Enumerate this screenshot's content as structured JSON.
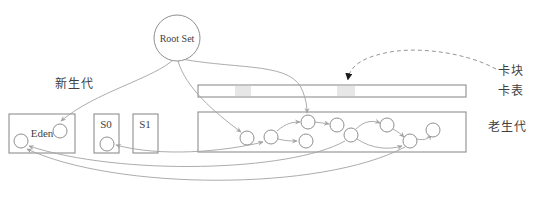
{
  "diagram": {
    "title_hint": "GC card table diagram",
    "colors": {
      "background": "#ffffff",
      "line": "#a3a3a3",
      "box_border": "#8f8f8f",
      "text": "#3f3f3f",
      "shaded_cell": "#e7e7e7",
      "dashed_arrow": "#8a8a8a",
      "dashed_arrowhead": "#1a1a1a"
    },
    "root_node": {
      "label": "Root Set",
      "cx": 177,
      "cy": 38,
      "r": 23
    },
    "labels": [
      {
        "id": "young-gen-label",
        "text": "新生代",
        "x": 74,
        "y": 88,
        "kind": "cn"
      },
      {
        "id": "card-block-label",
        "text": "卡块",
        "x": 511,
        "y": 75,
        "kind": "cn"
      },
      {
        "id": "card-table-label",
        "text": "卡表",
        "x": 511,
        "y": 95,
        "kind": "cn"
      },
      {
        "id": "old-gen-label",
        "text": "老生代",
        "x": 507,
        "y": 131,
        "kind": "cn"
      }
    ],
    "boxes": [
      {
        "id": "eden-box",
        "label": "Eden",
        "x": 9,
        "y": 114,
        "w": 66,
        "h": 39,
        "label_x": 42,
        "label_y": 137
      },
      {
        "id": "s0-box",
        "label": "S0",
        "x": 94,
        "y": 114,
        "w": 25,
        "h": 39,
        "label_x": 106,
        "label_y": 128
      },
      {
        "id": "s1-box",
        "label": "S1",
        "x": 133,
        "y": 114,
        "w": 25,
        "h": 39,
        "label_x": 145,
        "label_y": 128
      },
      {
        "id": "card-table-bar",
        "label": "",
        "x": 198,
        "y": 85,
        "w": 268,
        "h": 12
      },
      {
        "id": "old-gen-box",
        "label": "",
        "x": 198,
        "y": 112,
        "w": 268,
        "h": 40
      }
    ],
    "shaded_cells": [
      {
        "id": "marked-card-1",
        "x": 235,
        "y": 86,
        "w": 16,
        "h": 10
      },
      {
        "id": "marked-card-2",
        "x": 337,
        "y": 86,
        "w": 18,
        "h": 10
      }
    ],
    "object_nodes": [
      {
        "id": "eden-obj-left",
        "cx": 21,
        "cy": 141,
        "r": 7
      },
      {
        "id": "eden-obj-right",
        "cx": 60,
        "cy": 131,
        "r": 7
      },
      {
        "id": "s0-obj",
        "cx": 107,
        "cy": 144,
        "r": 7
      },
      {
        "id": "old-obj-1",
        "cx": 247,
        "cy": 138,
        "r": 7
      },
      {
        "id": "old-obj-2",
        "cx": 271,
        "cy": 137,
        "r": 7
      },
      {
        "id": "old-obj-3",
        "cx": 308,
        "cy": 122,
        "r": 7
      },
      {
        "id": "old-obj-4",
        "cx": 306,
        "cy": 141,
        "r": 7
      },
      {
        "id": "old-obj-5",
        "cx": 337,
        "cy": 125,
        "r": 7
      },
      {
        "id": "old-obj-6",
        "cx": 351,
        "cy": 135,
        "r": 7
      },
      {
        "id": "old-obj-7",
        "cx": 387,
        "cy": 125,
        "r": 7
      },
      {
        "id": "old-obj-8",
        "cx": 410,
        "cy": 141,
        "r": 7
      },
      {
        "id": "old-obj-9",
        "cx": 433,
        "cy": 130,
        "r": 7
      }
    ],
    "edges": [
      {
        "id": "root-to-eden-obj",
        "path": "M 174,59 C 155,78 95,92 61,121",
        "dashed": false,
        "start_arrow": false,
        "end_arrow": true,
        "dark": false
      },
      {
        "id": "root-to-old-obj-1",
        "path": "M 178,61 C 186,88 214,112 241,132",
        "dashed": false,
        "start_arrow": false,
        "end_arrow": true,
        "dark": false
      },
      {
        "id": "root-to-old-obj-3",
        "path": "M 181,59 C 243,70 293,62 303,92 C 306,100 307,106 307,113",
        "dashed": false,
        "start_arrow": false,
        "end_arrow": true,
        "dark": false
      },
      {
        "id": "s0-old-obj-2-link",
        "path": "M 116,145 C 160,157 222,152 263,142",
        "dashed": false,
        "start_arrow": true,
        "end_arrow": true,
        "dark": false
      },
      {
        "id": "old-2-to-old-3",
        "path": "M 277,131 C 286,123 293,122 300,122",
        "dashed": false,
        "start_arrow": false,
        "end_arrow": true,
        "dark": false
      },
      {
        "id": "old-2-to-old-4",
        "path": "M 278,139 C 286,141 290,141 297,141",
        "dashed": false,
        "start_arrow": false,
        "end_arrow": true,
        "dark": false
      },
      {
        "id": "old-3-to-old-5",
        "path": "M 315,122 C 321,123 324,123 329,124",
        "dashed": false,
        "start_arrow": false,
        "end_arrow": true,
        "dark": false
      },
      {
        "id": "old-6-to-old-7",
        "path": "M 356,129 C 364,121 372,120 380,123",
        "dashed": false,
        "start_arrow": false,
        "end_arrow": true,
        "dark": false
      },
      {
        "id": "old-7-to-old-8",
        "path": "M 393,129 C 398,132 401,134 404,137",
        "dashed": false,
        "start_arrow": false,
        "end_arrow": true,
        "dark": false
      },
      {
        "id": "old-6-to-old-8-low",
        "path": "M 357,139 C 372,149 389,150 402,146",
        "dashed": false,
        "start_arrow": false,
        "end_arrow": true,
        "dark": false
      },
      {
        "id": "old-8-to-old-9",
        "path": "M 417,139 C 425,141 429,138 431,135",
        "dashed": false,
        "start_arrow": false,
        "end_arrow": true,
        "dark": false
      },
      {
        "id": "old-6-to-eden-obj",
        "path": "M 345,141 C 290,172 120,176 29,146",
        "dashed": false,
        "start_arrow": false,
        "end_arrow": true,
        "dark": false
      },
      {
        "id": "old-8-to-eden-obj",
        "path": "M 405,147 C 320,192 115,190 27,149",
        "dashed": false,
        "start_arrow": false,
        "end_arrow": true,
        "dark": false
      },
      {
        "id": "card-block-pointer",
        "path": "M 496,69 C 465,52 415,46 385,53 C 362,58 350,66 348,79",
        "dashed": true,
        "start_arrow": false,
        "end_arrow": true,
        "dark": true
      }
    ]
  }
}
